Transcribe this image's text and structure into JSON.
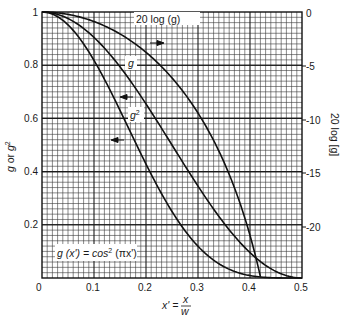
{
  "chart_data": {
    "type": "line",
    "title": "",
    "xlabel": "x' = x / w",
    "xlabel_parts": {
      "lhs": "x' =",
      "num": "x",
      "den": "w"
    },
    "ylabel_left": "g or g²",
    "ylabel_right": "20 log [g]",
    "xlim": [
      0,
      0.5
    ],
    "ylim_left": [
      0,
      1
    ],
    "ylim_right": [
      -24.3,
      0
    ],
    "grid": true,
    "x_ticks": [
      "0",
      "0.1",
      "0.2",
      "0.3",
      "0.4",
      "0.5"
    ],
    "y_ticks_left": [
      "0.2",
      "0.4",
      "0.6",
      "0.8",
      "1"
    ],
    "y_ticks_right": [
      "0",
      "-5",
      "-10",
      "-15",
      "-20"
    ],
    "formula": "g(x') = cos²(πx')",
    "x": [
      0,
      0.05,
      0.1,
      0.15,
      0.2,
      0.25,
      0.3,
      0.35,
      0.4,
      0.45,
      0.5
    ],
    "series": [
      {
        "name": "20 log (g)",
        "axis": "right",
        "values": [
          0,
          -0.43,
          -1.75,
          -4.07,
          -7.63,
          -12.0,
          -16.0,
          -20.0,
          -24.0,
          -24.3,
          -24.3
        ],
        "note": "follows 20·log10(cos²(πx')) until about x'≈0.42, then clipped at bottom"
      },
      {
        "name": "g",
        "axis": "left",
        "values": [
          1.0,
          0.976,
          0.905,
          0.794,
          0.655,
          0.5,
          0.345,
          0.206,
          0.095,
          0.024,
          0.0
        ]
      },
      {
        "name": "g²",
        "axis": "left",
        "values": [
          1.0,
          0.952,
          0.819,
          0.631,
          0.429,
          0.25,
          0.119,
          0.042,
          0.009,
          0.001,
          0.0
        ]
      }
    ],
    "annotations": [
      {
        "text": "20 log (g)",
        "arrow": "right"
      },
      {
        "text": "g",
        "arrow": "left"
      },
      {
        "text": "g²",
        "arrow": "left"
      }
    ]
  },
  "labels": {
    "curve_db": "20 log (g)",
    "curve_g": "g",
    "curve_g2_base": "g",
    "curve_g2_sup": "2",
    "formula_left": "g (x') = cos",
    "formula_sup": "2",
    "formula_right": " (πx')",
    "ylabel_left_g": "g",
    "ylabel_left_or": " or ",
    "ylabel_left_g2": "g",
    "ylabel_left_sup": "2",
    "ylabel_right": "20 log [g]",
    "xlabel_lhs": "x' =",
    "xlabel_num": "x",
    "xlabel_den": "w"
  },
  "ticks": {
    "x": [
      "0",
      "0.1",
      "0.2",
      "0.3",
      "0.4",
      "0.5"
    ],
    "left": [
      "1",
      "0.8",
      "0.6",
      "0.4",
      "0.2"
    ],
    "right": [
      "0",
      "-5",
      "-10",
      "-15",
      "-20"
    ]
  }
}
